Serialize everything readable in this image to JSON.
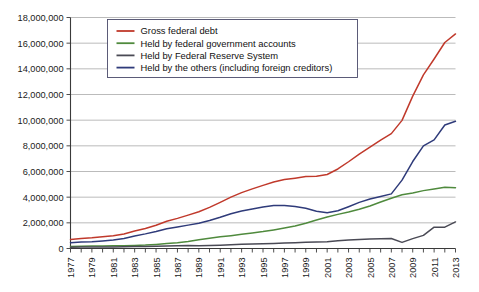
{
  "chart_data": {
    "type": "line",
    "title": "",
    "subtitle": "",
    "xlabel": "",
    "ylabel": "",
    "grid": true,
    "legend_position": "top-center",
    "xlim": [
      1977,
      2013
    ],
    "ylim": [
      0,
      18000000
    ],
    "x": [
      1977,
      1978,
      1979,
      1980,
      1981,
      1982,
      1983,
      1984,
      1985,
      1986,
      1987,
      1988,
      1989,
      1990,
      1991,
      1992,
      1993,
      1994,
      1995,
      1996,
      1997,
      1998,
      1999,
      2000,
      2001,
      2002,
      2003,
      2004,
      2005,
      2006,
      2007,
      2008,
      2009,
      2010,
      2011,
      2012,
      2013
    ],
    "xticks": [
      "1977",
      "1979",
      "1981",
      "1983",
      "1985",
      "1987",
      "1989",
      "1991",
      "1993",
      "1995",
      "1997",
      "1999",
      "2001",
      "2003",
      "2005",
      "2007",
      "2009",
      "2011",
      "2013"
    ],
    "yticks": [
      "0",
      "2,000,000",
      "4,000,000",
      "6,000,000",
      "8,000,000",
      "10,000,000",
      "12,000,000",
      "14,000,000",
      "16,000,000",
      "18,000,000"
    ],
    "ytick_values": [
      0,
      2000000,
      4000000,
      6000000,
      8000000,
      10000000,
      12000000,
      14000000,
      16000000,
      18000000
    ],
    "series": [
      {
        "name": "Gross federal debt",
        "color": "#c0392b",
        "values": [
          706000,
          777000,
          829000,
          909000,
          994000,
          1137000,
          1371000,
          1564000,
          1817000,
          2120000,
          2346000,
          2601000,
          2868000,
          3206000,
          3598000,
          4002000,
          4351000,
          4643000,
          4920000,
          5181000,
          5369000,
          5478000,
          5606000,
          5628000,
          5769000,
          6198000,
          6760000,
          7354000,
          7905000,
          8451000,
          8951000,
          9986000,
          11876000,
          13529000,
          14764000,
          16051000,
          16719000
        ]
      },
      {
        "name": "Held by federal government accounts",
        "color": "#4f8a3d",
        "values": [
          157000,
          169000,
          189000,
          198000,
          209000,
          218000,
          240000,
          265000,
          317000,
          384000,
          457000,
          551000,
          678000,
          795000,
          910000,
          1003000,
          1105000,
          1212000,
          1316000,
          1447000,
          1597000,
          1757000,
          1973000,
          2219000,
          2450000,
          2658000,
          2846000,
          3059000,
          3313000,
          3622000,
          3916000,
          4183000,
          4331000,
          4509000,
          4636000,
          4769000,
          4737000
        ]
      },
      {
        "name": "Held by Federal Reserve System",
        "color": "#4a4a55",
        "values": [
          102000,
          109000,
          117000,
          121000,
          124000,
          135000,
          155000,
          160000,
          169000,
          191000,
          212000,
          229000,
          220000,
          235000,
          259000,
          297000,
          325000,
          355000,
          374000,
          391000,
          424000,
          452000,
          496000,
          511000,
          534000,
          604000,
          656000,
          700000,
          736000,
          769000,
          780000,
          476000,
          769000,
          1021000,
          1664000,
          1660000,
          2072000
        ]
      },
      {
        "name": "Held by the others (including foreign creditors)",
        "color": "#2f3b7a",
        "values": [
          447000,
          499000,
          523000,
          590000,
          661000,
          784000,
          976000,
          1139000,
          1331000,
          1545000,
          1677000,
          1821000,
          1970000,
          2176000,
          2429000,
          2702000,
          2921000,
          3076000,
          3230000,
          3343000,
          3348000,
          3269000,
          3137000,
          2898000,
          2785000,
          2936000,
          3258000,
          3595000,
          3856000,
          4060000,
          4255000,
          5327000,
          6776000,
          7999000,
          8464000,
          9622000,
          9910000
        ]
      }
    ]
  },
  "legend": {
    "items": [
      {
        "label": "Gross federal debt",
        "color": "#c0392b"
      },
      {
        "label": "Held by federal government accounts",
        "color": "#4f8a3d"
      },
      {
        "label": "Held by Federal Reserve System",
        "color": "#4a4a55"
      },
      {
        "label": "Held by the others (including foreign creditors)",
        "color": "#2f3b7a"
      }
    ]
  }
}
